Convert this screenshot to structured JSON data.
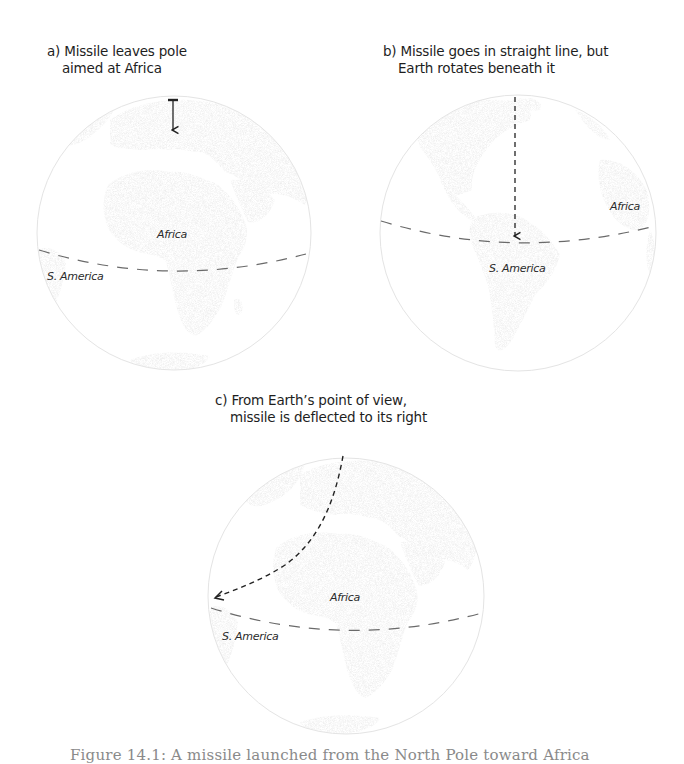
{
  "figure": {
    "top_caption_fragment": "",
    "bottom_caption": "Figure 14.1: A missile launched from the North Pole toward Africa"
  },
  "panels": [
    {
      "id": "a",
      "title_line1": "a) Missile leaves pole",
      "title_line2": "aimed at Africa",
      "labels": {
        "africa": "Africa",
        "s_america": "S. America"
      }
    },
    {
      "id": "b",
      "title_line1": "b) Missile goes in straight line, but",
      "title_line2": "Earth rotates beneath it",
      "labels": {
        "africa": "Africa",
        "s_america": "S. America"
      }
    },
    {
      "id": "c",
      "title_line1": "c) From Earth’s point of view,",
      "title_line2": "missile is deflected to its right",
      "labels": {
        "africa": "Africa",
        "s_america": "S. America"
      }
    }
  ],
  "colors": {
    "land": "#e2e2e2",
    "globe_outline": "#e6e6e6",
    "equator": "#6a6a6a",
    "missile_path": "#222222",
    "text": "#1e1e1e"
  }
}
